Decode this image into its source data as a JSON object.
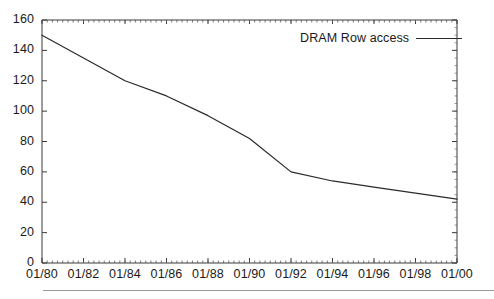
{
  "figure": {
    "background": "#ffffff",
    "axis_color": "#3a3a3a",
    "line_color": "#2b2b2b",
    "rule_color": "#9a9a9a"
  },
  "legend": {
    "label": "DRAM Row access",
    "swatch_name": "line-swatch",
    "position": "top-right-inside"
  },
  "chart_data": {
    "type": "line",
    "title": "",
    "subtitle": "",
    "xlabel": "",
    "ylabel": "",
    "grid": false,
    "legend_position": "top-right",
    "xlim": [
      1980,
      2000
    ],
    "ylim": [
      0,
      160
    ],
    "ytick_values": [
      0,
      20,
      40,
      60,
      80,
      100,
      120,
      140,
      160
    ],
    "ytick_labels": [
      "0",
      "20",
      "40",
      "60",
      "80",
      "100",
      "120",
      "140",
      "160"
    ],
    "xtick_values": [
      1980,
      1982,
      1984,
      1986,
      1988,
      1990,
      1992,
      1994,
      1996,
      1998,
      2000
    ],
    "xtick_labels": [
      "01/80",
      "01/82",
      "01/84",
      "01/86",
      "01/88",
      "01/90",
      "01/92",
      "01/94",
      "01/96",
      "01/98",
      "01/00"
    ],
    "minor_ticks": true,
    "series": [
      {
        "name": "DRAM Row access",
        "color": "#2b2b2b",
        "x": [
          1980,
          1982,
          1984,
          1986,
          1988,
          1990,
          1992,
          1994,
          1996,
          1998,
          2000
        ],
        "values": [
          150,
          135,
          120,
          110,
          97,
          82,
          60,
          54,
          50,
          46,
          42
        ]
      }
    ]
  }
}
